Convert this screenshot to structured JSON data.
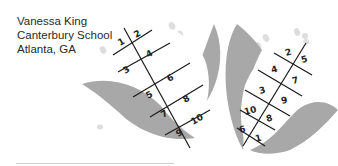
{
  "caption": {
    "name": "Vanessa King",
    "school": "Canterbury School",
    "location": "Atlanta, GA"
  },
  "colors": {
    "husk": "#a8a8a8",
    "cob": "#ffffff",
    "grid_line": "#1a1a1a",
    "kernel": "#e0e0e0",
    "text": "#2a2a2a"
  },
  "left_cob": {
    "cells": [
      [
        "1",
        "2"
      ],
      [
        "3",
        "4"
      ],
      [
        "5",
        "6"
      ],
      [
        "7",
        "8"
      ],
      [
        "9",
        "10"
      ]
    ]
  },
  "right_cob": {
    "cells": [
      [
        "2",
        "5"
      ],
      [
        "4",
        "7"
      ],
      [
        "3",
        "9"
      ],
      [
        "10",
        "8"
      ],
      [
        "6",
        "1"
      ]
    ]
  }
}
